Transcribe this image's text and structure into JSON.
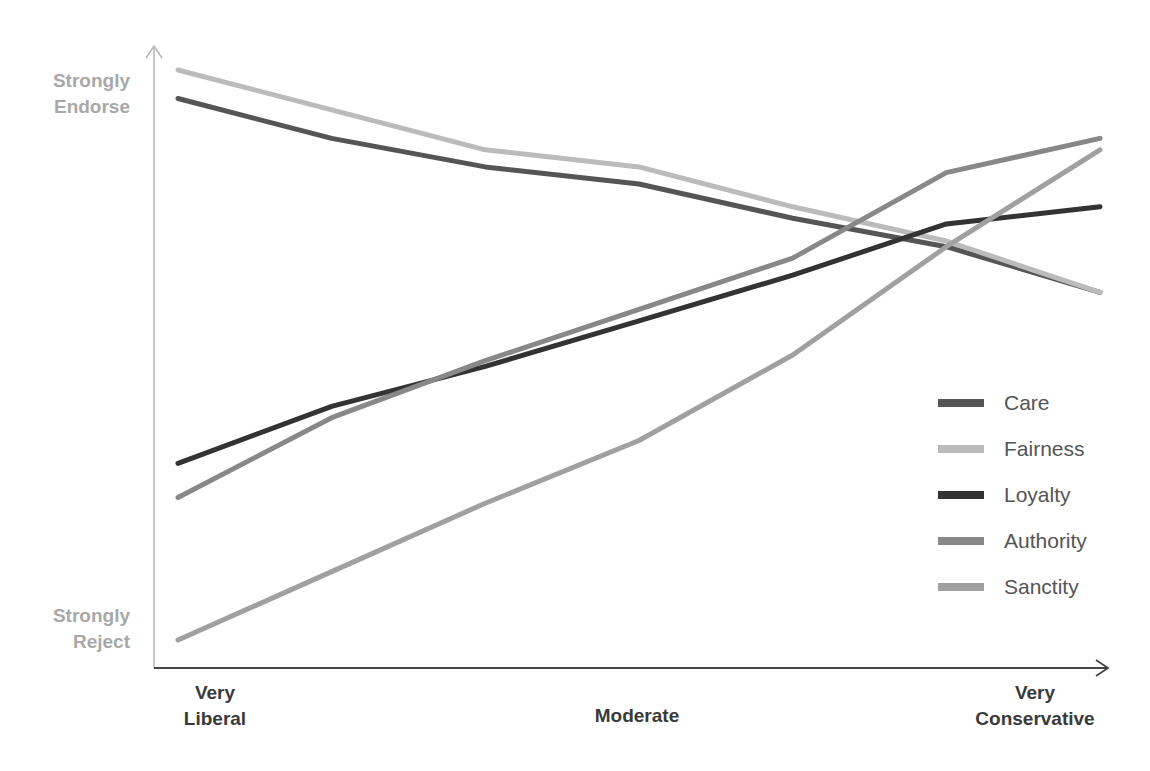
{
  "chart_data": {
    "type": "line",
    "title": "",
    "xlabel": "",
    "ylabel": "",
    "x": [
      "Very Liberal",
      "",
      "",
      "Moderate",
      "",
      "",
      "Very Conservative"
    ],
    "x_tick_labels": {
      "left": [
        "Very",
        "Liberal"
      ],
      "middle": [
        "Moderate"
      ],
      "right": [
        "Very",
        "Conservative"
      ]
    },
    "y_tick_labels": {
      "top": [
        "Strongly",
        "Endorse"
      ],
      "bottom": [
        "Strongly",
        "Reject"
      ]
    },
    "ylim": [
      0,
      10
    ],
    "grid": false,
    "legend_position": "lower right (inside)",
    "series": [
      {
        "name": "Care",
        "color": "#555555",
        "values": [
          9.5,
          8.8,
          8.3,
          8.0,
          7.4,
          6.9,
          6.1
        ]
      },
      {
        "name": "Fairness",
        "color": "#bbbbbb",
        "values": [
          10.0,
          9.3,
          8.6,
          8.3,
          7.6,
          7.0,
          6.1
        ]
      },
      {
        "name": "Loyalty",
        "color": "#333333",
        "values": [
          3.1,
          4.1,
          4.8,
          5.6,
          6.4,
          7.3,
          7.6
        ]
      },
      {
        "name": "Authority",
        "color": "#888888",
        "values": [
          2.5,
          3.9,
          4.9,
          5.8,
          6.7,
          8.2,
          8.8
        ]
      },
      {
        "name": "Sanctity",
        "color": "#a0a0a0",
        "values": [
          0.0,
          1.2,
          2.4,
          3.5,
          5.0,
          6.9,
          8.6
        ]
      }
    ]
  },
  "axes": {
    "y_top_label": [
      "Strongly",
      "Endorse"
    ],
    "y_bottom_label": [
      "Strongly",
      "Reject"
    ],
    "x_left_label": [
      "Very",
      "Liberal"
    ],
    "x_middle_label": "Moderate",
    "x_right_label": [
      "Very",
      "Conservative"
    ]
  },
  "legend": [
    {
      "label": "Care",
      "color": "#555555"
    },
    {
      "label": "Fairness",
      "color": "#bbbbbb"
    },
    {
      "label": "Loyalty",
      "color": "#333333"
    },
    {
      "label": "Authority",
      "color": "#888888"
    },
    {
      "label": "Sanctity",
      "color": "#a0a0a0"
    }
  ]
}
